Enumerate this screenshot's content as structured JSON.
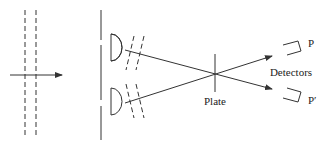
{
  "diagram": {
    "title": "",
    "labels": {
      "plate": "Plate",
      "detectors": "Detectors",
      "detector_top": "P",
      "detector_bottom": "P′"
    },
    "elements": [
      "incoming-wavefronts",
      "incoming-beam-arrow",
      "double-slit-screen",
      "upper-lens",
      "lower-lens",
      "upper-beam",
      "lower-beam",
      "plate",
      "detector-p",
      "detector-p-prime"
    ],
    "colors": {
      "line": "#333333",
      "text": "#222222",
      "background": "#ffffff"
    }
  }
}
